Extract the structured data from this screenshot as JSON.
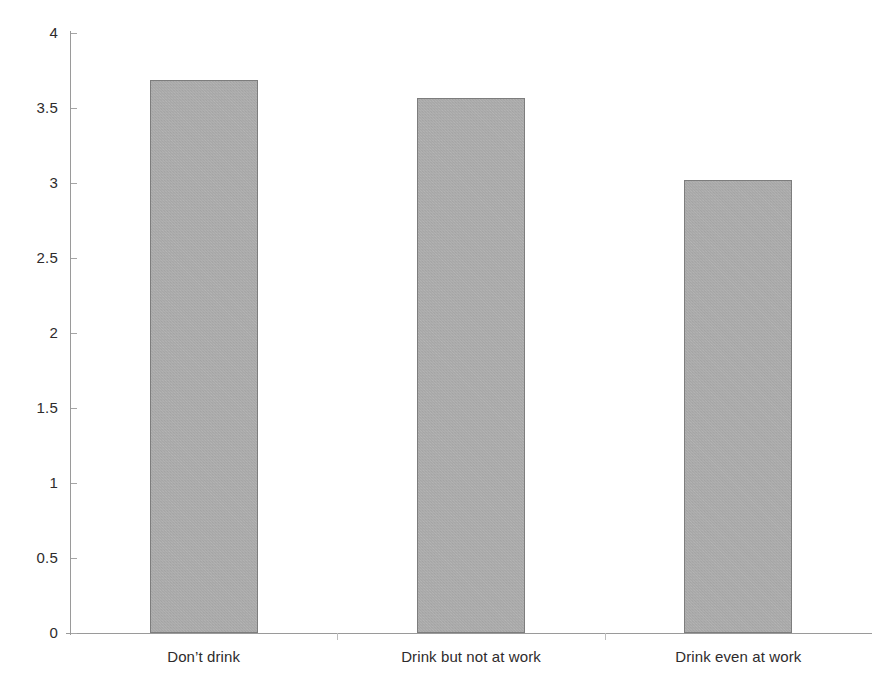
{
  "chart_data": {
    "type": "bar",
    "title": "",
    "subtitle": "",
    "xlabel": "",
    "ylabel": "",
    "categories": [
      "Don’t drink",
      "Drink but not at work",
      "Drink even at work"
    ],
    "values": [
      3.69,
      3.57,
      3.02
    ],
    "ylim": [
      0,
      4
    ],
    "yticks": [
      0,
      0.5,
      1,
      1.5,
      2,
      2.5,
      3,
      3.5,
      4
    ],
    "ytick_labels": [
      "0",
      "0.5",
      "1",
      "1.5",
      "2",
      "2.5",
      "3",
      "3.5",
      "4"
    ],
    "grid": false,
    "legend": null,
    "legend_position": "none",
    "annotations": [],
    "series": [
      {
        "name": "",
        "values": [
          3.69,
          3.57,
          3.02
        ]
      }
    ],
    "bar_color": "#b3b3b3",
    "bar_edge_color": "#7d7d7d",
    "axis_color": "#9a9a9a",
    "text_color": "#2e2b2c",
    "background_color": "#ffffff"
  }
}
